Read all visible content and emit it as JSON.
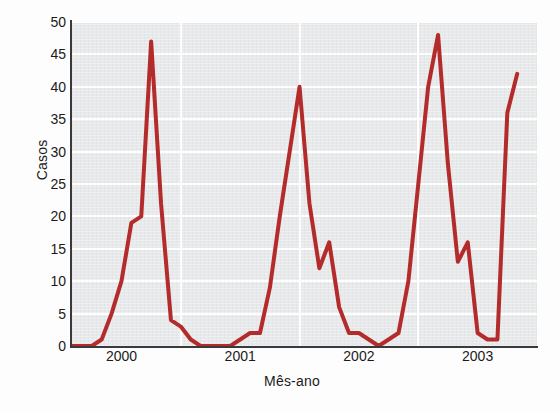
{
  "chart_data": {
    "type": "line",
    "title": "",
    "subtitle": "",
    "xlabel": "Mês-ano",
    "ylabel": "Casos",
    "ylim": [
      0,
      50
    ],
    "yticks": [
      0,
      5,
      10,
      15,
      20,
      25,
      30,
      35,
      40,
      45,
      50
    ],
    "xtick_labels": [
      "2000",
      "2001",
      "2002",
      "2003"
    ],
    "xtick_values": [
      3,
      15,
      27,
      39
    ],
    "xlim": [
      -2,
      45
    ],
    "grid": true,
    "legend": false,
    "legend_position": "none",
    "series": [
      {
        "name": "Casos",
        "color": "#b42b2b",
        "x": [
          -2,
          -1,
          0,
          1,
          2,
          3,
          4,
          5,
          6,
          7,
          8,
          9,
          10,
          11,
          12,
          13,
          14,
          15,
          16,
          17,
          18,
          19,
          20,
          21,
          22,
          23,
          24,
          25,
          26,
          27,
          28,
          29,
          30,
          31,
          32,
          33,
          34,
          35,
          36,
          37,
          38,
          39,
          40,
          41,
          42,
          43
        ],
        "values": [
          0,
          0,
          0,
          1,
          5,
          10,
          19,
          20,
          47,
          22,
          4,
          3,
          1,
          0,
          0,
          0,
          0,
          1,
          2,
          2,
          9,
          20,
          30,
          40,
          22,
          12,
          16,
          6,
          2,
          2,
          1,
          0,
          1,
          2,
          10,
          25,
          40,
          48,
          28,
          13,
          16,
          2,
          1,
          1,
          36,
          42
        ]
      }
    ],
    "annotations": [],
    "colors": {
      "line": "#b42b2b",
      "plot_background": "#e6e8e9",
      "grid": "#ffffff",
      "axis": "#3a3a3a",
      "text": "#1b1b1b",
      "page_background": "#fdfdfd"
    }
  }
}
